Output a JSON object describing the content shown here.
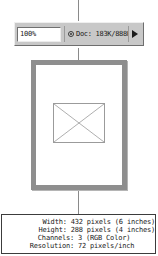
{
  "status_bar": {
    "zoom_value": "100%",
    "doc_icon": "document-status-icon",
    "doc_text": "Doc: 183K/888K",
    "arrow_icon": "right-triangle-icon"
  },
  "document_preview": {
    "placeholder_icon": "crossed-box-placeholder-icon"
  },
  "info_panel": {
    "rows": [
      {
        "label": "Width:",
        "value": "432 pixels (6 inches)"
      },
      {
        "label": "Height:",
        "value": "288 pixels (4 inches)"
      },
      {
        "label": "Channels:",
        "value": "3 (RGB Color)"
      },
      {
        "label": "Resolution:",
        "value": "72 pixels/inch"
      }
    ]
  },
  "colors": {
    "status_bar_face": "#c8c8c8",
    "page_border": "#8e8e8e",
    "connector": "#8a8a8a",
    "text": "#1a1a1a"
  }
}
